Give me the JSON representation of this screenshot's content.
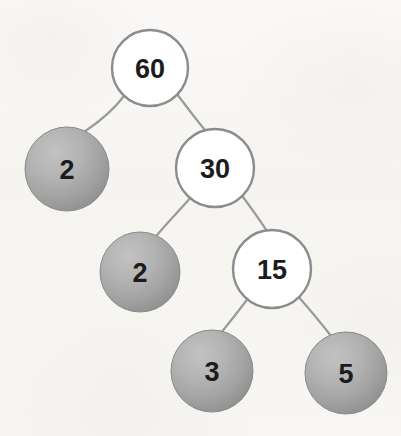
{
  "diagram": {
    "type": "binary-tree",
    "background_color": "#f6f5f3",
    "width": 401,
    "height": 436,
    "styles": {
      "internal_node": {
        "fill": "#ffffff",
        "stroke": "#8c8c8c",
        "stroke_width": 2.4,
        "text_color": "#1c1c1c"
      },
      "leaf_node": {
        "fill_center": "#b3b3b3",
        "fill_edge": "#8f8f8f",
        "stroke": "#8a8a8a",
        "stroke_width": 1,
        "text_color": "#1c1c1c"
      },
      "edge": {
        "stroke": "#9a9a9a",
        "stroke_width": 2.2
      }
    },
    "nodes": [
      {
        "id": "n60",
        "label": "60",
        "kind": "open",
        "cx": 150,
        "cy": 68,
        "r": 38,
        "font_size": 27
      },
      {
        "id": "n2a",
        "label": "2",
        "kind": "filled",
        "cx": 67,
        "cy": 169,
        "r": 42,
        "font_size": 27
      },
      {
        "id": "n30",
        "label": "30",
        "kind": "open",
        "cx": 215,
        "cy": 168,
        "r": 39,
        "font_size": 27
      },
      {
        "id": "n2b",
        "label": "2",
        "kind": "filled",
        "cx": 140,
        "cy": 272,
        "r": 40,
        "font_size": 27
      },
      {
        "id": "n15",
        "label": "15",
        "kind": "open",
        "cx": 272,
        "cy": 269,
        "r": 39,
        "font_size": 27
      },
      {
        "id": "n3",
        "label": "3",
        "kind": "filled",
        "cx": 212,
        "cy": 371,
        "r": 41,
        "font_size": 27
      },
      {
        "id": "n5",
        "label": "5",
        "kind": "filled",
        "cx": 346,
        "cy": 373,
        "r": 41,
        "font_size": 27
      }
    ],
    "edges": [
      {
        "id": "e1",
        "from": "n60",
        "to": "n2a",
        "path": "M 124 96 C 112 112 96 124 84 132"
      },
      {
        "id": "e2",
        "from": "n60",
        "to": "n30",
        "path": "M 177 94 C 189 110 198 122 205 130"
      },
      {
        "id": "e3",
        "from": "n30",
        "to": "n2b",
        "path": "M 192 196 C 178 212 166 224 157 235"
      },
      {
        "id": "e4",
        "from": "n30",
        "to": "n15",
        "path": "M 240 193 C 252 209 261 222 267 231"
      },
      {
        "id": "e5",
        "from": "n15",
        "to": "n3",
        "path": "M 249 297 C 238 312 228 324 221 333"
      },
      {
        "id": "e6",
        "from": "n15",
        "to": "n5",
        "path": "M 297 295 C 310 310 322 324 331 336"
      }
    ],
    "traversal_values": [
      60,
      2,
      30,
      2,
      15,
      3,
      5
    ]
  }
}
